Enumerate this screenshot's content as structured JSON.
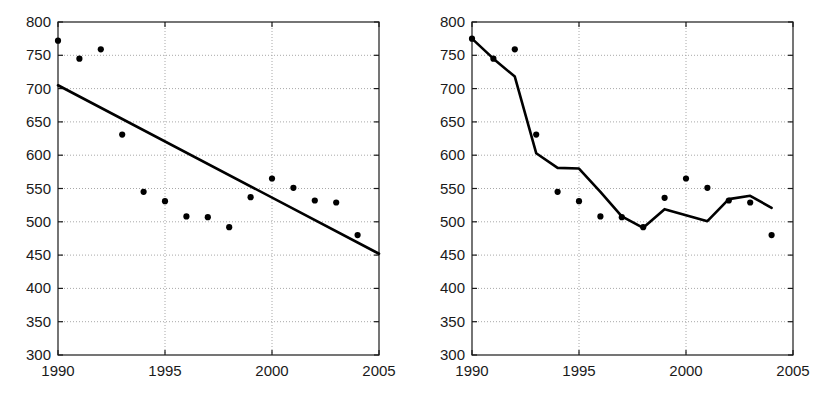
{
  "figure": {
    "background_color": "#ffffff",
    "ink_color": "#1a1a1a",
    "grid_color": "#a8a8a8",
    "panel_count": 2
  },
  "chart_data": [
    {
      "id": "left-panel",
      "type": "scatter",
      "title": "",
      "xlabel": "",
      "ylabel": "",
      "xlim": [
        1990,
        2005
      ],
      "ylim": [
        300,
        800
      ],
      "xticks": [
        1990,
        1995,
        2000,
        2005
      ],
      "xtick_labels": [
        "1990",
        "1995",
        "2000",
        "2005"
      ],
      "yticks": [
        300,
        350,
        400,
        450,
        500,
        550,
        600,
        650,
        700,
        750,
        800
      ],
      "ytick_labels": [
        "300",
        "350",
        "400",
        "450",
        "500",
        "550",
        "600",
        "650",
        "700",
        "750",
        "800"
      ],
      "grid": true,
      "grid_style": "dotted",
      "legend": "none",
      "series": [
        {
          "name": "observations",
          "type": "scatter",
          "marker": "filled-circle",
          "color": "#000000",
          "x": [
            1990,
            1991,
            1992,
            1993,
            1994,
            1995,
            1996,
            1997,
            1998,
            1999,
            2000,
            2001,
            2002,
            2003,
            2004
          ],
          "values": [
            772,
            745,
            759,
            631,
            545,
            531,
            508,
            507,
            492,
            537,
            565,
            551,
            532,
            529,
            480
          ]
        },
        {
          "name": "linear-trend",
          "type": "line",
          "color": "#000000",
          "x": [
            1990,
            2005
          ],
          "values": [
            705,
            452
          ]
        }
      ]
    },
    {
      "id": "right-panel",
      "type": "scatter",
      "title": "",
      "xlabel": "",
      "ylabel": "",
      "xlim": [
        1990,
        2005
      ],
      "ylim": [
        300,
        800
      ],
      "xticks": [
        1990,
        1995,
        2000,
        2005
      ],
      "xtick_labels": [
        "1990",
        "1995",
        "2000",
        "2005"
      ],
      "yticks": [
        300,
        350,
        400,
        450,
        500,
        550,
        600,
        650,
        700,
        750,
        800
      ],
      "ytick_labels": [
        "300",
        "350",
        "400",
        "450",
        "500",
        "550",
        "600",
        "650",
        "700",
        "750",
        "800"
      ],
      "grid": true,
      "grid_style": "dotted",
      "legend": "none",
      "series": [
        {
          "name": "observations",
          "type": "scatter",
          "marker": "filled-circle",
          "color": "#000000",
          "x": [
            1990,
            1991,
            1992,
            1993,
            1994,
            1995,
            1996,
            1997,
            1998,
            1999,
            2000,
            2001,
            2002,
            2003,
            2004
          ],
          "values": [
            775,
            745,
            759,
            631,
            545,
            531,
            508,
            507,
            492,
            536,
            565,
            551,
            532,
            529,
            480
          ]
        },
        {
          "name": "fitted-curve",
          "type": "line",
          "color": "#000000",
          "x": [
            1990,
            1991,
            1992,
            1993,
            1994,
            1995,
            1996,
            1997,
            1998,
            1999,
            2000,
            2001,
            2002,
            2003,
            2004
          ],
          "values": [
            775,
            745,
            718,
            603,
            581,
            580,
            545,
            508,
            491,
            519,
            510,
            501,
            534,
            539,
            521
          ]
        }
      ]
    }
  ]
}
